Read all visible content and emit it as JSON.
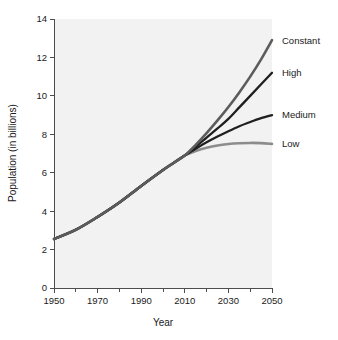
{
  "chart_data": {
    "type": "line",
    "title": "",
    "xlabel": "Year",
    "ylabel": "Population (in billions)",
    "xlim": [
      1950,
      2050
    ],
    "ylim": [
      0,
      14
    ],
    "grid": false,
    "legend_position": "right-of-axes-inline",
    "xticks": [
      1950,
      1970,
      1990,
      2010,
      2030,
      2050
    ],
    "xtick_labels": [
      "1950",
      "1970",
      "1990",
      "2010",
      "2030",
      "2050"
    ],
    "xminor_ticks": [
      1960,
      1980,
      2000,
      2020,
      2040
    ],
    "yticks": [
      0,
      2,
      4,
      6,
      8,
      10,
      12,
      14
    ],
    "ytick_labels": [
      "0",
      "2",
      "4",
      "6",
      "8",
      "10",
      "12",
      "14"
    ],
    "x": [
      1950,
      1960,
      1970,
      1980,
      1990,
      2000,
      2005,
      2010,
      2015,
      2020,
      2025,
      2030,
      2035,
      2040,
      2045,
      2050
    ],
    "series": [
      {
        "name": "Constant",
        "color": "#5c5c5c",
        "width": 2.6,
        "values": [
          2.55,
          3.03,
          3.7,
          4.45,
          5.31,
          6.14,
          6.52,
          6.9,
          7.45,
          8.06,
          8.72,
          9.42,
          10.18,
          11.0,
          11.9,
          12.9
        ]
      },
      {
        "name": "High",
        "color": "#1f1f1f",
        "width": 2.3,
        "values": [
          2.55,
          3.03,
          3.7,
          4.45,
          5.31,
          6.14,
          6.52,
          6.9,
          7.35,
          7.83,
          8.31,
          8.8,
          9.4,
          10.0,
          10.6,
          11.2
        ]
      },
      {
        "name": "Medium",
        "color": "#1f1f1f",
        "width": 2.3,
        "values": [
          2.55,
          3.03,
          3.7,
          4.45,
          5.31,
          6.14,
          6.52,
          6.9,
          7.25,
          7.58,
          7.88,
          8.16,
          8.42,
          8.64,
          8.84,
          9.0
        ]
      },
      {
        "name": "Low",
        "color": "#8c8c8c",
        "width": 2.6,
        "values": [
          2.55,
          3.03,
          3.7,
          4.45,
          5.31,
          6.14,
          6.52,
          6.9,
          7.13,
          7.3,
          7.42,
          7.49,
          7.53,
          7.55,
          7.54,
          7.5
        ]
      }
    ],
    "series_label_values": [
      {
        "name": "Constant",
        "label_y": 12.9
      },
      {
        "name": "High",
        "label_y": 11.2
      },
      {
        "name": "Medium",
        "label_y": 9.0
      },
      {
        "name": "Low",
        "label_y": 7.5
      }
    ]
  },
  "colors": {
    "plot_background": "#f2f2f2",
    "page_background": "#ffffff",
    "axis": "#4d4d4d",
    "text": "#1a1a1a"
  }
}
